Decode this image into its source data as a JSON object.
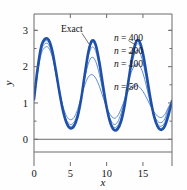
{
  "figure": {
    "background": "#fefefe",
    "frame_color": "#6b6b6b",
    "curve_color": "#1e50a8",
    "curve_color_light": "#4a7fd0",
    "zero_line_color": "#6b6b6b"
  },
  "chart_data": {
    "type": "line",
    "title": "",
    "xlabel": "x",
    "ylabel": "y",
    "xlim": [
      0,
      19
    ],
    "ylim": [
      -0.35,
      3.45
    ],
    "xticks": [
      0,
      5,
      10,
      15
    ],
    "xtick_labels": [
      "0",
      "5",
      "10",
      "15"
    ],
    "yticks": [
      0,
      1,
      2,
      3
    ],
    "ytick_labels": [
      "0",
      "1",
      "2",
      "3"
    ],
    "minor_yticks": [
      0.5,
      1.5,
      2.5,
      3.0
    ],
    "grid": false,
    "legend_position": "inline-annotations",
    "annotations": [
      {
        "text": "Exact",
        "x": 5.2,
        "y": 3.05
      },
      {
        "text": "n = 400",
        "x": 11.0,
        "y": 2.8
      },
      {
        "text": "n = 200",
        "x": 11.0,
        "y": 2.45
      },
      {
        "text": "n = 100",
        "x": 11.0,
        "y": 2.1
      },
      {
        "text": "n = 50",
        "x": 11.0,
        "y": 1.45
      }
    ],
    "series": [
      {
        "name": "Exact",
        "x": [
          0,
          0.5,
          1,
          1.5,
          2,
          2.5,
          3,
          3.5,
          4,
          4.5,
          5,
          5.5,
          6,
          6.5,
          7,
          7.5,
          8,
          8.5,
          9,
          9.5,
          10,
          10.5,
          11,
          11.5,
          12,
          12.5,
          13,
          13.5,
          14,
          14.5,
          15,
          15.5,
          16,
          16.5,
          17,
          17.5,
          18,
          18.5,
          19
        ],
        "values": [
          1.1,
          1.95,
          2.55,
          2.76,
          2.74,
          2.45,
          1.9,
          1.3,
          0.78,
          0.44,
          0.3,
          0.36,
          0.62,
          1.12,
          1.8,
          2.42,
          2.72,
          2.6,
          2.12,
          1.48,
          0.88,
          0.46,
          0.26,
          0.28,
          0.5,
          0.96,
          1.6,
          2.24,
          2.66,
          2.7,
          2.36,
          1.78,
          1.16,
          0.66,
          0.36,
          0.26,
          0.36,
          0.66,
          1.05
        ]
      },
      {
        "name": "n = 400",
        "x": [
          0,
          0.5,
          1,
          1.5,
          2,
          2.5,
          3,
          3.5,
          4,
          4.5,
          5,
          5.5,
          6,
          6.5,
          7,
          7.5,
          8,
          8.5,
          9,
          9.5,
          10,
          10.5,
          11,
          11.5,
          12,
          12.5,
          13,
          13.5,
          14,
          14.5,
          15,
          15.5,
          16,
          16.5,
          17,
          17.5,
          18,
          18.5,
          19
        ],
        "values": [
          1.1,
          1.94,
          2.53,
          2.74,
          2.72,
          2.43,
          1.88,
          1.29,
          0.78,
          0.45,
          0.32,
          0.38,
          0.64,
          1.13,
          1.79,
          2.38,
          2.66,
          2.54,
          2.08,
          1.46,
          0.88,
          0.48,
          0.29,
          0.32,
          0.54,
          0.99,
          1.6,
          2.2,
          2.58,
          2.6,
          2.28,
          1.72,
          1.13,
          0.66,
          0.38,
          0.3,
          0.4,
          0.7,
          1.05
        ]
      },
      {
        "name": "n = 200",
        "x": [
          0,
          0.5,
          1,
          1.5,
          2,
          2.5,
          3,
          3.5,
          4,
          4.5,
          5,
          5.5,
          6,
          6.5,
          7,
          7.5,
          8,
          8.5,
          9,
          9.5,
          10,
          10.5,
          11,
          11.5,
          12,
          12.5,
          13,
          13.5,
          14,
          14.5,
          15,
          15.5,
          16,
          16.5,
          17,
          17.5,
          18,
          18.5,
          19
        ],
        "values": [
          1.1,
          1.92,
          2.5,
          2.7,
          2.68,
          2.4,
          1.86,
          1.28,
          0.79,
          0.47,
          0.35,
          0.41,
          0.67,
          1.14,
          1.76,
          2.3,
          2.54,
          2.42,
          1.99,
          1.41,
          0.87,
          0.5,
          0.33,
          0.37,
          0.6,
          1.04,
          1.6,
          2.1,
          2.42,
          2.42,
          2.12,
          1.62,
          1.08,
          0.66,
          0.42,
          0.36,
          0.46,
          0.76,
          1.05
        ]
      },
      {
        "name": "n = 100",
        "x": [
          0,
          0.5,
          1,
          1.5,
          2,
          2.5,
          3,
          3.5,
          4,
          4.5,
          5,
          5.5,
          6,
          6.5,
          7,
          7.5,
          8,
          8.5,
          9,
          9.5,
          10,
          10.5,
          11,
          11.5,
          12,
          12.5,
          13,
          13.5,
          14,
          14.5,
          15,
          15.5,
          16,
          16.5,
          17,
          17.5,
          18,
          18.5,
          19
        ],
        "values": [
          1.1,
          1.88,
          2.44,
          2.63,
          2.61,
          2.34,
          1.83,
          1.28,
          0.82,
          0.52,
          0.41,
          0.47,
          0.72,
          1.15,
          1.68,
          2.1,
          2.26,
          2.14,
          1.79,
          1.31,
          0.86,
          0.56,
          0.41,
          0.47,
          0.72,
          1.12,
          1.57,
          1.9,
          2.06,
          2.04,
          1.82,
          1.44,
          1.02,
          0.68,
          0.5,
          0.46,
          0.56,
          0.84,
          1.05
        ]
      },
      {
        "name": "n = 50",
        "x": [
          0,
          0.5,
          1,
          1.5,
          2,
          2.5,
          3,
          3.5,
          4,
          4.5,
          5,
          5.5,
          6,
          6.5,
          7,
          7.5,
          8,
          8.5,
          9,
          9.5,
          10,
          10.5,
          11,
          11.5,
          12,
          12.5,
          13,
          13.5,
          14,
          14.5,
          15,
          15.5,
          16,
          16.5,
          17,
          17.5,
          18,
          18.5,
          19
        ],
        "values": [
          1.1,
          1.82,
          2.35,
          2.53,
          2.52,
          2.28,
          1.82,
          1.32,
          0.9,
          0.63,
          0.54,
          0.6,
          0.82,
          1.16,
          1.5,
          1.72,
          1.78,
          1.68,
          1.46,
          1.16,
          0.88,
          0.68,
          0.58,
          0.64,
          0.84,
          1.1,
          1.33,
          1.47,
          1.5,
          1.44,
          1.32,
          1.14,
          0.94,
          0.76,
          0.64,
          0.6,
          0.68,
          0.88,
          1.05
        ]
      }
    ]
  }
}
